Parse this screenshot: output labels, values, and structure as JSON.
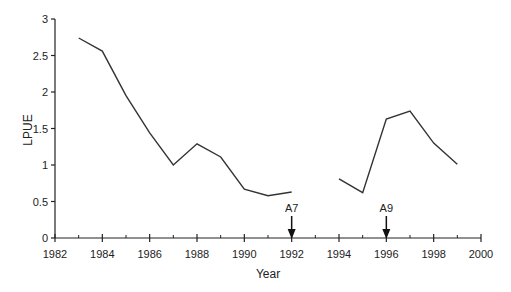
{
  "chart_data": {
    "type": "line",
    "title": "",
    "xlabel": "Year",
    "ylabel": "LPUE",
    "xlim": [
      1982,
      2000
    ],
    "ylim": [
      0,
      3
    ],
    "xticks": [
      1982,
      1984,
      1986,
      1988,
      1990,
      1992,
      1994,
      1996,
      1998,
      2000
    ],
    "xticks_minor": [
      1983,
      1985,
      1987,
      1989,
      1991,
      1993,
      1995,
      1997,
      1999
    ],
    "yticks": [
      0,
      0.5,
      1,
      1.5,
      2,
      2.5,
      3
    ],
    "ytick_labels": [
      "0",
      "0.5",
      "1",
      "1.5",
      "2",
      "2.5",
      "3"
    ],
    "xtick_labels": [
      "1982",
      "1984",
      "1986",
      "1988",
      "1990",
      "1992",
      "1994",
      "1996",
      "1998",
      "2000"
    ],
    "grid": false,
    "legend": null,
    "series": [
      {
        "name": "LPUE",
        "color": "#333333",
        "x": [
          1983,
          1984,
          1985,
          1986,
          1987,
          1988,
          1989,
          1990,
          1991,
          1992,
          1993,
          1994,
          1995,
          1996,
          1997,
          1998,
          1999
        ],
        "values": [
          2.74,
          2.56,
          1.95,
          1.44,
          1.0,
          1.29,
          1.11,
          0.67,
          0.58,
          0.63,
          null,
          0.81,
          0.62,
          1.63,
          1.74,
          1.3,
          1.01
        ]
      }
    ],
    "annotations": [
      {
        "label": "A7",
        "x": 1992,
        "type": "down-arrow"
      },
      {
        "label": "A9",
        "x": 1996,
        "type": "down-arrow"
      }
    ]
  }
}
